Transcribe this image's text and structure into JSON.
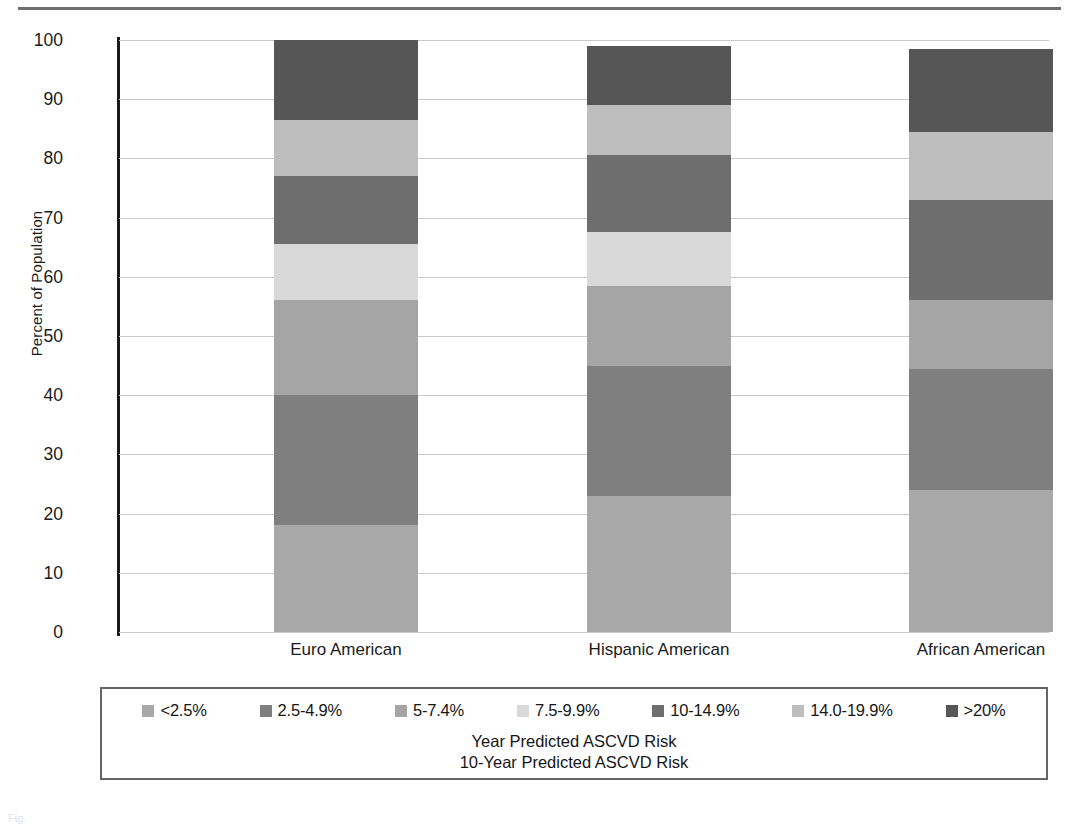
{
  "chart_data": {
    "type": "bar",
    "subtype": "stacked-bar-100-percent",
    "title": "",
    "xlabel": "",
    "ylabel": "Percent of Population",
    "ylim": [
      0,
      100
    ],
    "yticks": [
      0,
      10,
      20,
      30,
      40,
      50,
      60,
      70,
      80,
      90,
      100
    ],
    "ytick_labels": [
      "0",
      "10",
      "20",
      "30",
      "40",
      "50",
      "60",
      "70",
      "80",
      "90",
      "100"
    ],
    "grid": true,
    "legend_position": "bottom",
    "categories": [
      "Euro American",
      "Hispanic American",
      "African American"
    ],
    "series": [
      {
        "name": "<2.5%",
        "color": "#a8a8a8",
        "values": [
          18.0,
          23.0,
          24.0
        ]
      },
      {
        "name": "2.5-4.9%",
        "color": "#7f7f7f",
        "values": [
          22.0,
          22.0,
          20.5
        ]
      },
      {
        "name": "5-7.4%",
        "color": "#a5a5a5",
        "values": [
          16.0,
          13.5,
          11.5
        ]
      },
      {
        "name": "7.5-9.9%",
        "color": "#d9d9d9",
        "values": [
          9.5,
          9.0,
          0.0
        ]
      },
      {
        "name": "10-14.9%",
        "color": "#6e6e6e",
        "values": [
          11.5,
          13.0,
          17.0
        ]
      },
      {
        "name": "14.0-19.9%",
        "color": "#bdbdbd",
        "values": [
          9.5,
          8.5,
          11.5
        ]
      },
      {
        "name": ">20%",
        "color": "#565656",
        "values": [
          13.5,
          10.0,
          14.0
        ]
      }
    ],
    "segment_boundaries": {
      "Euro American": [
        0,
        18.0,
        40.0,
        56.0,
        65.5,
        77.0,
        86.5,
        100.0
      ],
      "Hispanic American": [
        0,
        23.0,
        45.0,
        58.5,
        67.5,
        80.5,
        89.0,
        99.0
      ],
      "African American": [
        0,
        24.0,
        44.5,
        56.0,
        56.0,
        73.0,
        84.5,
        98.5
      ]
    },
    "bar_totals": [
      100.0,
      99.0,
      98.5
    ],
    "annotations": [
      "Year Predicted ASCVD Risk",
      "10-Year Predicted ASCVD Risk"
    ]
  },
  "axis": {
    "y_title": "Percent of Population",
    "y_ticks": [
      "100",
      "90",
      "80",
      "70",
      "60",
      "50",
      "40",
      "30",
      "20",
      "10",
      "0"
    ],
    "x_categories": [
      "Euro American",
      "Hispanic American",
      "African American"
    ]
  },
  "legend": {
    "items": [
      {
        "label": "<2.5%",
        "color": "#a8a8a8"
      },
      {
        "label": "2.5-4.9%",
        "color": "#7f7f7f"
      },
      {
        "label": "5-7.4%",
        "color": "#a5a5a5"
      },
      {
        "label": "7.5-9.9%",
        "color": "#d9d9d9"
      },
      {
        "label": "10-14.9%",
        "color": "#6e6e6e"
      },
      {
        "label": "14.0-19.9%",
        "color": "#bdbdbd"
      },
      {
        "label": ">20%",
        "color": "#565656"
      }
    ],
    "caption_line1": "Year Predicted ASCVD Risk",
    "caption_line2": "10-Year Predicted ASCVD Risk"
  },
  "footer": {
    "caption": "Fig."
  }
}
